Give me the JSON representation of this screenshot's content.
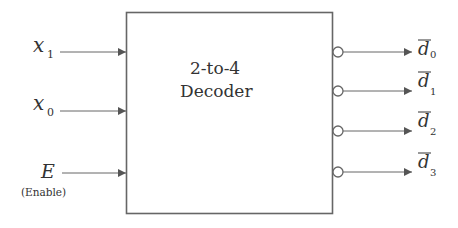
{
  "block": {
    "title_line1": "2-to-4",
    "title_line2": "Decoder"
  },
  "inputs": [
    {
      "name": "x",
      "sub": "1",
      "y": 52
    },
    {
      "name": "x",
      "sub": "0",
      "y": 111
    },
    {
      "name": "E",
      "sub": "",
      "y": 173,
      "note": "(Enable)"
    }
  ],
  "outputs": [
    {
      "name": "d",
      "sub": "0",
      "overbar": true,
      "y": 52
    },
    {
      "name": "d",
      "sub": "1",
      "overbar": true,
      "y": 91
    },
    {
      "name": "d",
      "sub": "2",
      "overbar": true,
      "y": 131
    },
    {
      "name": "d",
      "sub": "3",
      "overbar": true,
      "y": 172
    }
  ],
  "colors": {
    "line": "#555555",
    "arrow": "#555555",
    "text": "#333333"
  }
}
